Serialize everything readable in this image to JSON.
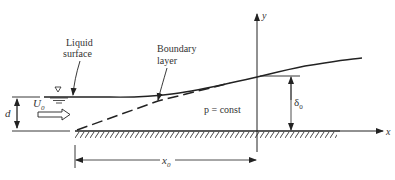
{
  "diagram": {
    "labels": {
      "liquid_surface_line1": "Liquid",
      "liquid_surface_line2": "surface",
      "boundary_layer_line1": "Boundary",
      "boundary_layer_line2": "layer",
      "y_axis": "y",
      "x_axis": "x",
      "depth": "d",
      "velocity": "U",
      "velocity_sub": "0",
      "pressure": "p = const",
      "delta": "δ",
      "delta_sub": "0",
      "distance": "x",
      "distance_sub": "0"
    },
    "colors": {
      "ink": "#222222",
      "background": "#ffffff"
    }
  }
}
